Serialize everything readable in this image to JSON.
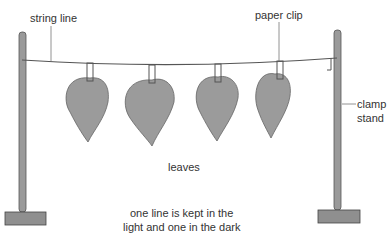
{
  "labels": {
    "string_line": "string line",
    "paper_clip": "paper clip",
    "clamp_stand_1": "clamp",
    "clamp_stand_2": "stand",
    "leaves": "leaves",
    "caption_1": "one line is kept in the",
    "caption_2": "light and one in the dark"
  },
  "colors": {
    "leaf": "#9a9a9a",
    "stand": "#8a8a8a",
    "line": "#666666"
  }
}
